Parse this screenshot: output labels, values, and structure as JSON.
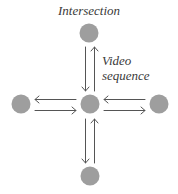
{
  "diagram": {
    "title": "Intersection",
    "edge_label_line1": "Video",
    "edge_label_line2": "sequence",
    "node_color": "#9e9e9e",
    "arrow_color": "#555555",
    "text_color": "#3a3a3a",
    "nodes": [
      {
        "id": "top",
        "cx": 89,
        "cy": 33
      },
      {
        "id": "left",
        "cx": 21,
        "cy": 104
      },
      {
        "id": "center",
        "cx": 90,
        "cy": 104
      },
      {
        "id": "right",
        "cx": 159,
        "cy": 104
      },
      {
        "id": "bottom",
        "cx": 90,
        "cy": 176
      }
    ],
    "edges": [
      {
        "from": "top",
        "to": "center",
        "bidirectional": true
      },
      {
        "from": "left",
        "to": "center",
        "bidirectional": true
      },
      {
        "from": "right",
        "to": "center",
        "bidirectional": true
      },
      {
        "from": "bottom",
        "to": "center",
        "bidirectional": true
      }
    ]
  }
}
